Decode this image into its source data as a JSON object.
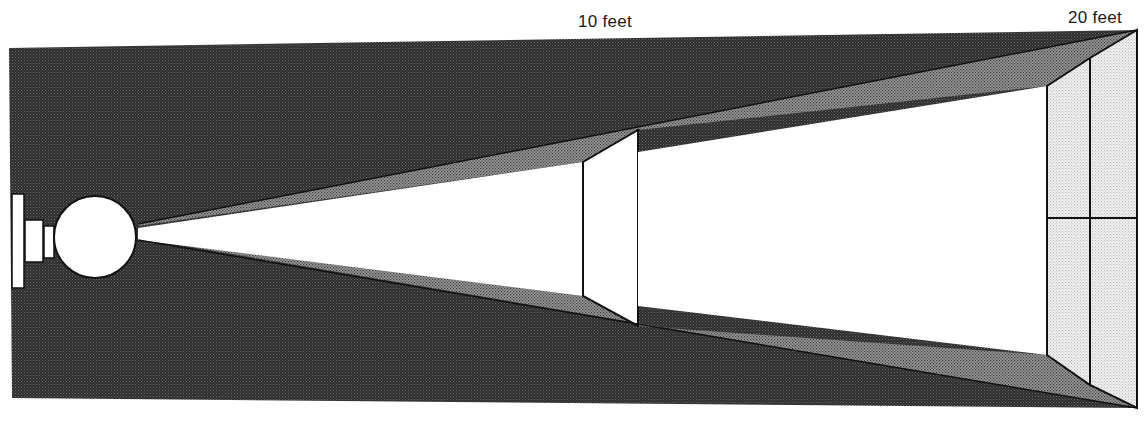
{
  "labels": {
    "distance_10": "10 feet",
    "distance_20": "20 feet"
  },
  "colors": {
    "background_field": "#3a3a3a",
    "beam_edge": "#8a8a8a",
    "beam_fill": "#ffffff",
    "far_screen": "#e2e2e2",
    "outline": "#111111"
  },
  "elements": {
    "light_source": "lamp-with-spherical-bulb",
    "near_screen": "panel-at-10-feet",
    "far_screen": "2x2-grid-panel-at-20-feet"
  }
}
